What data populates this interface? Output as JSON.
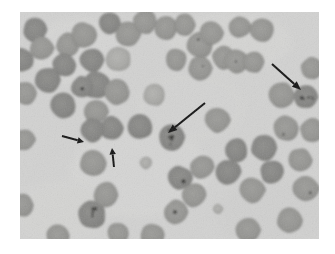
{
  "figure": {
    "kind": "photomicrograph",
    "alt_text": "Grayscale light micrograph of a blood smear showing numerous round erythrocytes on a pale background; four black arrows (two large, two small) point to darkly stippled infected cells.",
    "frame": {
      "x": 20,
      "y": 12,
      "width": 299,
      "height": 227
    }
  },
  "colors": {
    "page_background": "#ffffff",
    "plasma_background": "#d2d2d1",
    "plasma_background_light": "#dcdcda",
    "cell_fill": "#949491",
    "cell_fill_dark": "#848482",
    "cell_fill_light": "#a2a29f",
    "cell_edge": "#7d7d7a",
    "inclusion_dark": "#2a2a28",
    "arrow_black": "#111111"
  },
  "arrows": [
    {
      "id": "arrow-large-center",
      "label": "large arrow pointing down-left to infected cell",
      "size": "large",
      "direction": "down-left",
      "tail": {
        "x": 205,
        "y": 103
      },
      "tip": {
        "x": 168,
        "y": 133
      }
    },
    {
      "id": "arrow-large-upper-right",
      "label": "large arrow pointing down-right to infected cell",
      "size": "large",
      "direction": "down-right",
      "tail": {
        "x": 272,
        "y": 64
      },
      "tip": {
        "x": 301,
        "y": 90
      }
    },
    {
      "id": "arrow-small-left",
      "label": "small arrow pointing right",
      "size": "small",
      "direction": "right",
      "tail": {
        "x": 62,
        "y": 136
      },
      "tip": {
        "x": 84,
        "y": 142
      }
    },
    {
      "id": "arrow-small-lower",
      "label": "small arrow pointing up",
      "size": "small",
      "direction": "up",
      "tail": {
        "x": 114,
        "y": 167
      },
      "tip": {
        "x": 112,
        "y": 148
      }
    }
  ],
  "cells": [
    {
      "cx": 35,
      "cy": 30,
      "r": 12,
      "tone": "dark",
      "stipple": 0
    },
    {
      "cx": 22,
      "cy": 60,
      "r": 12,
      "tone": "dark",
      "stipple": 0
    },
    {
      "cx": 42,
      "cy": 48,
      "r": 12,
      "tone": "mid",
      "stipple": 0
    },
    {
      "cx": 68,
      "cy": 45,
      "r": 12,
      "tone": "mid",
      "stipple": 0
    },
    {
      "cx": 64,
      "cy": 65,
      "r": 12,
      "tone": "dark",
      "stipple": 0
    },
    {
      "cx": 25,
      "cy": 93,
      "r": 12,
      "tone": "mid",
      "stipple": 0
    },
    {
      "cx": 48,
      "cy": 80,
      "r": 13,
      "tone": "dark",
      "stipple": 0
    },
    {
      "cx": 84,
      "cy": 35,
      "r": 13,
      "tone": "mid",
      "stipple": 0
    },
    {
      "cx": 92,
      "cy": 60,
      "r": 12,
      "tone": "dark",
      "stipple": 0
    },
    {
      "cx": 96,
      "cy": 85,
      "r": 14,
      "tone": "dark",
      "stipple": 0
    },
    {
      "cx": 63,
      "cy": 106,
      "r": 13,
      "tone": "dark",
      "stipple": 0
    },
    {
      "cx": 96,
      "cy": 112,
      "r": 12,
      "tone": "mid",
      "stipple": 0
    },
    {
      "cx": 128,
      "cy": 34,
      "r": 13,
      "tone": "mid",
      "stipple": 0
    },
    {
      "cx": 110,
      "cy": 23,
      "r": 11,
      "tone": "dark",
      "stipple": 0
    },
    {
      "cx": 118,
      "cy": 59,
      "r": 13,
      "tone": "light",
      "stipple": 0
    },
    {
      "cx": 82,
      "cy": 87,
      "r": 11,
      "tone": "dark",
      "stipple": 1
    },
    {
      "cx": 117,
      "cy": 92,
      "r": 13,
      "tone": "mid",
      "stipple": 0
    },
    {
      "cx": 140,
      "cy": 127,
      "r": 13,
      "tone": "dark",
      "stipple": 0
    },
    {
      "cx": 112,
      "cy": 128,
      "r": 12,
      "tone": "dark",
      "stipple": 0
    },
    {
      "cx": 92,
      "cy": 130,
      "r": 12,
      "tone": "dark",
      "stipple": 0
    },
    {
      "cx": 93,
      "cy": 163,
      "r": 13,
      "tone": "mid",
      "stipple": 0
    },
    {
      "cx": 92,
      "cy": 215,
      "r": 14,
      "tone": "dark",
      "stipple": 4
    },
    {
      "cx": 106,
      "cy": 195,
      "r": 13,
      "tone": "mid",
      "stipple": 0
    },
    {
      "cx": 166,
      "cy": 28,
      "r": 12,
      "tone": "mid",
      "stipple": 0
    },
    {
      "cx": 185,
      "cy": 25,
      "r": 11,
      "tone": "mid",
      "stipple": 0
    },
    {
      "cx": 200,
      "cy": 45,
      "r": 13,
      "tone": "mid",
      "stipple": 1
    },
    {
      "cx": 176,
      "cy": 60,
      "r": 11,
      "tone": "mid",
      "stipple": 0
    },
    {
      "cx": 200,
      "cy": 68,
      "r": 12,
      "tone": "mid",
      "stipple": 1
    },
    {
      "cx": 145,
      "cy": 22,
      "r": 12,
      "tone": "mid",
      "stipple": 0
    },
    {
      "cx": 224,
      "cy": 58,
      "r": 12,
      "tone": "mid",
      "stipple": 0
    },
    {
      "cx": 172,
      "cy": 137,
      "r": 14,
      "tone": "dark",
      "stipple": 6
    },
    {
      "cx": 218,
      "cy": 120,
      "r": 13,
      "tone": "mid",
      "stipple": 0
    },
    {
      "cx": 211,
      "cy": 33,
      "r": 12,
      "tone": "mid",
      "stipple": 0
    },
    {
      "cx": 240,
      "cy": 27,
      "r": 11,
      "tone": "mid",
      "stipple": 0
    },
    {
      "cx": 262,
      "cy": 30,
      "r": 12,
      "tone": "mid",
      "stipple": 0
    },
    {
      "cx": 236,
      "cy": 61,
      "r": 12,
      "tone": "mid",
      "stipple": 1
    },
    {
      "cx": 254,
      "cy": 62,
      "r": 11,
      "tone": "mid",
      "stipple": 0
    },
    {
      "cx": 282,
      "cy": 95,
      "r": 13,
      "tone": "mid",
      "stipple": 0
    },
    {
      "cx": 306,
      "cy": 97,
      "r": 12,
      "tone": "dark",
      "stipple": 5
    },
    {
      "cx": 312,
      "cy": 68,
      "r": 11,
      "tone": "mid",
      "stipple": 0
    },
    {
      "cx": 286,
      "cy": 128,
      "r": 13,
      "tone": "mid",
      "stipple": 1
    },
    {
      "cx": 312,
      "cy": 130,
      "r": 12,
      "tone": "mid",
      "stipple": 0
    },
    {
      "cx": 264,
      "cy": 148,
      "r": 13,
      "tone": "dark",
      "stipple": 0
    },
    {
      "cx": 236,
      "cy": 150,
      "r": 12,
      "tone": "dark",
      "stipple": 0
    },
    {
      "cx": 228,
      "cy": 172,
      "r": 13,
      "tone": "dark",
      "stipple": 0
    },
    {
      "cx": 202,
      "cy": 167,
      "r": 12,
      "tone": "mid",
      "stipple": 0
    },
    {
      "cx": 180,
      "cy": 178,
      "r": 12,
      "tone": "dark",
      "stipple": 1
    },
    {
      "cx": 194,
      "cy": 195,
      "r": 12,
      "tone": "mid",
      "stipple": 0
    },
    {
      "cx": 176,
      "cy": 212,
      "r": 12,
      "tone": "mid",
      "stipple": 1
    },
    {
      "cx": 252,
      "cy": 190,
      "r": 13,
      "tone": "mid",
      "stipple": 0
    },
    {
      "cx": 272,
      "cy": 172,
      "r": 12,
      "tone": "dark",
      "stipple": 0
    },
    {
      "cx": 300,
      "cy": 160,
      "r": 12,
      "tone": "mid",
      "stipple": 0
    },
    {
      "cx": 306,
      "cy": 188,
      "r": 13,
      "tone": "mid",
      "stipple": 1
    },
    {
      "cx": 290,
      "cy": 220,
      "r": 13,
      "tone": "mid",
      "stipple": 0
    },
    {
      "cx": 248,
      "cy": 230,
      "r": 12,
      "tone": "mid",
      "stipple": 0
    },
    {
      "cx": 152,
      "cy": 235,
      "r": 12,
      "tone": "mid",
      "stipple": 0
    },
    {
      "cx": 118,
      "cy": 233,
      "r": 11,
      "tone": "mid",
      "stipple": 0
    },
    {
      "cx": 58,
      "cy": 236,
      "r": 12,
      "tone": "mid",
      "stipple": 0
    },
    {
      "cx": 22,
      "cy": 205,
      "r": 12,
      "tone": "mid",
      "stipple": 0
    },
    {
      "cx": 24,
      "cy": 140,
      "r": 11,
      "tone": "mid",
      "stipple": 0
    },
    {
      "cx": 154,
      "cy": 95,
      "r": 11,
      "tone": "light",
      "stipple": 0
    },
    {
      "cx": 146,
      "cy": 163,
      "r": 6,
      "tone": "light",
      "stipple": 0
    },
    {
      "cx": 218,
      "cy": 209,
      "r": 5,
      "tone": "light",
      "stipple": 0
    }
  ]
}
